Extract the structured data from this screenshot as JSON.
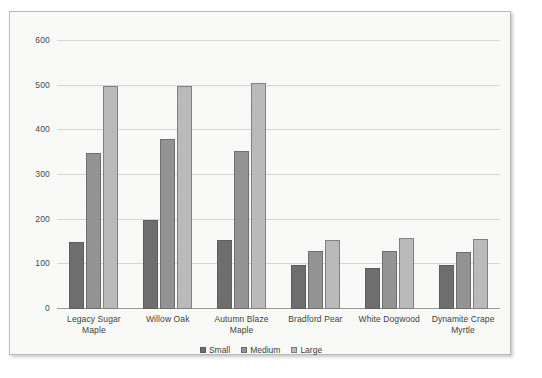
{
  "chart_data": {
    "type": "bar",
    "title": "",
    "xlabel": "",
    "ylabel": "",
    "ylim": [
      0,
      600
    ],
    "ytick_values": [
      0,
      100,
      200,
      300,
      400,
      500,
      600
    ],
    "ytick_labels": [
      "0",
      "100",
      "200",
      "300",
      "400",
      "500",
      "600"
    ],
    "grid": true,
    "legend_position": "bottom-center",
    "categories": [
      "Legacy Sugar Maple",
      "Willow Oak",
      "Autumn Blaze Maple",
      "Bradford Pear",
      "White Dogwood",
      "Dynamite Crape Myrtle"
    ],
    "series": [
      {
        "name": "Small",
        "color": "#6f6f6f",
        "values": [
          150,
          200,
          155,
          98,
          92,
          98
        ]
      },
      {
        "name": "Medium",
        "color": "#949494",
        "values": [
          350,
          380,
          353,
          130,
          130,
          128
        ]
      },
      {
        "name": "Large",
        "color": "#bcbcbc",
        "values": [
          500,
          500,
          505,
          155,
          158,
          157
        ]
      }
    ]
  },
  "legend": {
    "items": [
      {
        "label": "Small"
      },
      {
        "label": "Medium"
      },
      {
        "label": "Large"
      }
    ]
  },
  "colors": {
    "small": "#6f6f6f",
    "medium": "#949494",
    "large": "#bcbcbc",
    "frame_border": "#b9b9b6",
    "plot_background": "#fbfbfa",
    "gridline": "#d8d8d4",
    "axis": "#9a9a96",
    "text": "#3f3f3f"
  }
}
